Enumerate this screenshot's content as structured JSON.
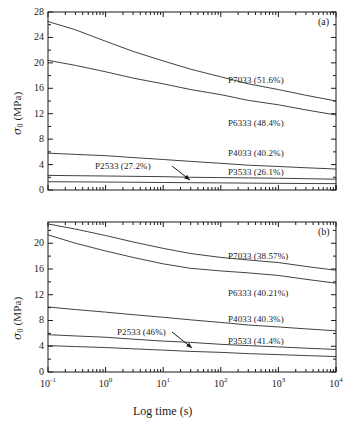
{
  "figure": {
    "xlabel": "Log time (s)",
    "ylabel_sigma": "σ",
    "ylabel_sub": "0",
    "ylabel_unit": " (MPa)",
    "xticks": [
      {
        "mant": "10",
        "exp": "-1"
      },
      {
        "mant": "10",
        "exp": "0"
      },
      {
        "mant": "10",
        "exp": "1"
      },
      {
        "mant": "10",
        "exp": "2"
      },
      {
        "mant": "10",
        "exp": "3"
      },
      {
        "mant": "10",
        "exp": "4"
      }
    ],
    "line_color": "#2b2b2b",
    "axis_color": "#1a1a1a"
  },
  "panel_a": {
    "tag": "(a)",
    "yticks": [
      "0",
      "4",
      "8",
      "12",
      "16",
      "20",
      "24",
      "28"
    ],
    "labels": [
      {
        "text": "P7033 (51.6%)",
        "x": 228,
        "y": 75
      },
      {
        "text": "P6333 (48.4%)",
        "x": 228,
        "y": 118
      },
      {
        "text": "P4033 (40.2%)",
        "x": 228,
        "y": 148
      },
      {
        "text": "P3533 (26.1%)",
        "x": 228,
        "y": 167
      },
      {
        "text": "P2533 (27.2%)",
        "x": 95,
        "y": 161
      }
    ],
    "arrow": {
      "x1": 172,
      "y1": 166,
      "x2": 190,
      "y2": 180
    }
  },
  "panel_b": {
    "tag": "(b)",
    "yticks": [
      "0",
      "4",
      "8",
      "12",
      "16",
      "20"
    ],
    "labels": [
      {
        "text": "P7033 (38.57%)",
        "x": 228,
        "y": 251
      },
      {
        "text": "P6333 (40.21%)",
        "x": 228,
        "y": 288
      },
      {
        "text": "P4033 (40.3%)",
        "x": 228,
        "y": 314
      },
      {
        "text": "P3533 (41.4%)",
        "x": 228,
        "y": 336
      },
      {
        "text": "P2533 (46%)",
        "x": 117,
        "y": 327
      }
    ],
    "arrow": {
      "x1": 172,
      "y1": 332,
      "x2": 192,
      "y2": 348
    }
  },
  "chart_data": [
    {
      "type": "line",
      "title": "(a) Stress relaxation — σ0 vs log time",
      "xlabel": "Log time (s)",
      "ylabel": "σ0 (MPa)",
      "xscale": "log",
      "xlim": [
        0.1,
        10000
      ],
      "ylim": [
        0,
        28
      ],
      "ytick_step": 4,
      "grid": false,
      "legend": "inline-annotations",
      "x": [
        0.1,
        0.3,
        1,
        3,
        10,
        30,
        100,
        300,
        1000,
        3000,
        10000
      ],
      "series": [
        {
          "name": "P7033 (51.6%)",
          "values": [
            26.5,
            25.2,
            23.4,
            21.8,
            20.3,
            19.0,
            17.8,
            16.7,
            15.8,
            14.9,
            14.0
          ]
        },
        {
          "name": "P6333 (48.4%)",
          "values": [
            20.4,
            19.6,
            18.6,
            17.6,
            16.7,
            15.8,
            15.0,
            14.1,
            13.4,
            12.6,
            11.8
          ]
        },
        {
          "name": "P4033 (40.2%)",
          "values": [
            5.8,
            5.6,
            5.4,
            5.1,
            4.8,
            4.5,
            4.2,
            3.9,
            3.7,
            3.5,
            3.3
          ]
        },
        {
          "name": "P3533 (26.1%)",
          "values": [
            2.3,
            2.25,
            2.2,
            2.15,
            2.1,
            2.0,
            1.95,
            1.9,
            1.85,
            1.78,
            1.7
          ]
        },
        {
          "name": "P2533 (27.2%)",
          "values": [
            1.3,
            1.28,
            1.25,
            1.22,
            1.18,
            1.15,
            1.12,
            1.08,
            1.05,
            1.02,
            1.0
          ]
        }
      ]
    },
    {
      "type": "line",
      "title": "(b) Stress relaxation — σ0 vs log time",
      "xlabel": "Log time (s)",
      "ylabel": "σ0 (MPa)",
      "xscale": "log",
      "xlim": [
        0.1,
        10000
      ],
      "ylim": [
        0,
        23
      ],
      "ytick_step": 4,
      "grid": false,
      "legend": "inline-annotations",
      "x": [
        0.1,
        0.3,
        1,
        3,
        10,
        30,
        100,
        300,
        1000,
        3000,
        10000
      ],
      "series": [
        {
          "name": "P7033 (38.57%)",
          "values": [
            23.0,
            22.2,
            21.2,
            20.2,
            19.2,
            18.4,
            17.8,
            17.4,
            17.0,
            16.4,
            15.8
          ]
        },
        {
          "name": "P6333 (40.21%)",
          "values": [
            21.3,
            20.0,
            18.8,
            17.8,
            16.8,
            16.1,
            15.7,
            15.4,
            15.0,
            14.4,
            13.8
          ]
        },
        {
          "name": "P4033 (40.3%)",
          "values": [
            10.1,
            9.7,
            9.3,
            8.9,
            8.5,
            8.1,
            7.7,
            7.3,
            7.0,
            6.7,
            6.4
          ]
        },
        {
          "name": "P3533 (41.4%)",
          "values": [
            5.8,
            5.6,
            5.4,
            5.1,
            4.8,
            4.6,
            4.3,
            4.1,
            3.9,
            3.7,
            3.5
          ]
        },
        {
          "name": "P2533 (46%)",
          "values": [
            4.1,
            3.95,
            3.8,
            3.6,
            3.4,
            3.2,
            3.05,
            2.85,
            2.7,
            2.55,
            2.4
          ]
        }
      ]
    }
  ]
}
